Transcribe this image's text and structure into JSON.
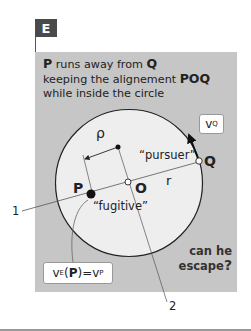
{
  "panel_label": "E",
  "heading": {
    "line1": {
      "bold1": "P",
      "text": " runs away from ",
      "bold2": "Q"
    },
    "line2": {
      "text": "keeping the alignement ",
      "bold": "POQ"
    },
    "line3": "while inside the circle"
  },
  "points": {
    "P": "P",
    "O": "O",
    "Q": "Q"
  },
  "labels": {
    "rho": "ρ",
    "r": "r",
    "pursuer": "“pursuer”",
    "fugitive": "“fugitive”",
    "callout1": "1",
    "callout2": "2"
  },
  "velocity_Q": {
    "v": "v",
    "sub": "Q"
  },
  "velocity_P": {
    "v": "v",
    "sub1": "E",
    "open": "(",
    "P": "P",
    "close": ")",
    "eq": "=v",
    "sub2": "P"
  },
  "question": {
    "line1": "can he",
    "line2": "escape",
    "mark": "?"
  },
  "colors": {
    "panel": "#c6c6c6",
    "circle_fill": "#eeeeee",
    "badge": "#4a4a4a"
  }
}
